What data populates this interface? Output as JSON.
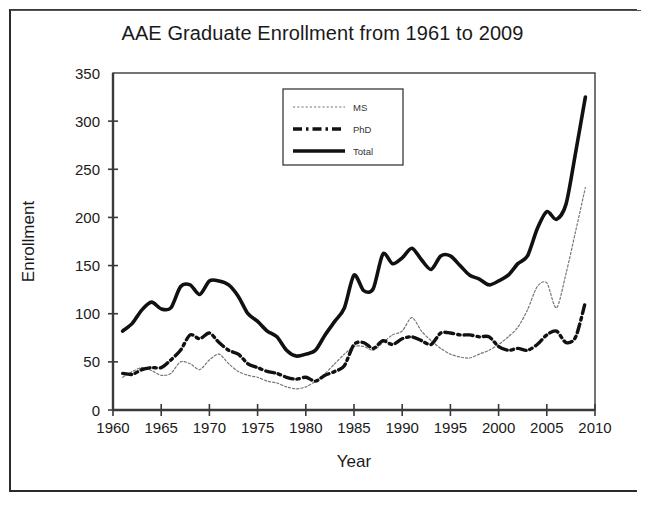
{
  "chart_data": {
    "type": "line",
    "title": "AAE Graduate Enrollment from 1961 to 2009",
    "xlabel": "Year",
    "ylabel": "Enrollment",
    "xlim": [
      1960,
      2010
    ],
    "ylim": [
      0,
      350
    ],
    "xticks": [
      1960,
      1965,
      1970,
      1975,
      1980,
      1985,
      1990,
      1995,
      2000,
      2005,
      2010
    ],
    "yticks": [
      0,
      50,
      100,
      150,
      200,
      250,
      300,
      350
    ],
    "grid": false,
    "legend_position": "top-center",
    "x": [
      1961,
      1962,
      1963,
      1964,
      1965,
      1966,
      1967,
      1968,
      1969,
      1970,
      1971,
      1972,
      1973,
      1974,
      1975,
      1976,
      1977,
      1978,
      1979,
      1980,
      1981,
      1982,
      1983,
      1984,
      1985,
      1986,
      1987,
      1988,
      1989,
      1990,
      1991,
      1992,
      1993,
      1994,
      1995,
      1996,
      1997,
      1998,
      1999,
      2000,
      2001,
      2002,
      2003,
      2004,
      2005,
      2006,
      2007,
      2008,
      2009
    ],
    "series": [
      {
        "name": "MS",
        "style": "dotted-thin",
        "values": [
          34,
          40,
          44,
          41,
          36,
          38,
          50,
          48,
          42,
          52,
          58,
          48,
          40,
          36,
          34,
          30,
          28,
          24,
          22,
          24,
          30,
          38,
          48,
          58,
          66,
          66,
          62,
          70,
          78,
          82,
          96,
          82,
          72,
          64,
          58,
          55,
          54,
          58,
          62,
          68,
          76,
          86,
          104,
          128,
          132,
          106,
          142,
          186,
          231
        ]
      },
      {
        "name": "PhD",
        "style": "dash-dot-thick",
        "values": [
          38,
          37,
          42,
          44,
          44,
          52,
          62,
          78,
          74,
          80,
          70,
          62,
          58,
          48,
          44,
          40,
          38,
          34,
          32,
          34,
          30,
          36,
          40,
          46,
          68,
          70,
          64,
          72,
          68,
          74,
          76,
          72,
          68,
          80,
          80,
          78,
          78,
          76,
          76,
          66,
          62,
          64,
          62,
          68,
          78,
          82,
          70,
          76,
          112
        ]
      },
      {
        "name": "Total",
        "style": "solid-thick",
        "values": [
          82,
          90,
          104,
          112,
          105,
          106,
          128,
          130,
          120,
          134,
          134,
          130,
          118,
          100,
          92,
          82,
          76,
          62,
          56,
          58,
          62,
          78,
          92,
          106,
          140,
          124,
          126,
          162,
          152,
          158,
          168,
          156,
          146,
          160,
          160,
          150,
          140,
          136,
          130,
          134,
          140,
          152,
          160,
          188,
          206,
          198,
          214,
          268,
          325
        ]
      }
    ]
  },
  "legend": {
    "items": [
      {
        "label": "MS"
      },
      {
        "label": "PhD"
      },
      {
        "label": "Total"
      }
    ]
  },
  "colors": {
    "ink": "#1a1a1a",
    "axis": "#3a3a3a",
    "ms": "#777777",
    "phd": "#111111",
    "total": "#111111",
    "background": "#ffffff"
  }
}
